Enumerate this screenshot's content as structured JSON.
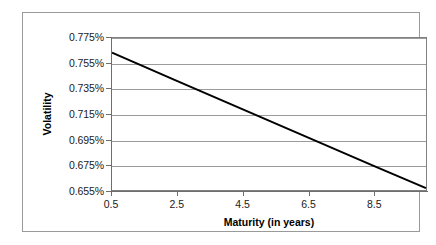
{
  "chart_data": {
    "type": "line",
    "title": "",
    "xlabel": "Maturity (in years)",
    "ylabel": "Volatility",
    "xlim": [
      0.5,
      10.1
    ],
    "ylim": [
      0.655,
      0.775
    ],
    "grid": true,
    "legend": false,
    "x_tick_labels": [
      "0.5",
      "2.5",
      "4.5",
      "6.5",
      "8.5"
    ],
    "x_tick_values": [
      0.5,
      2.5,
      4.5,
      6.5,
      8.5
    ],
    "y_tick_labels": [
      "0.775%",
      "0.755%",
      "0.735%",
      "0.715%",
      "0.695%",
      "0.675%",
      "0.655%"
    ],
    "y_tick_values": [
      0.775,
      0.755,
      0.735,
      0.715,
      0.695,
      0.675,
      0.655
    ],
    "y_unit": "%",
    "series": [
      {
        "name": "Volatility",
        "color": "#000000",
        "line_width": 2,
        "x": [
          0.5,
          2.5,
          4.5,
          6.5,
          8.5,
          10.1
        ],
        "y": [
          0.7635,
          0.741,
          0.7187,
          0.6963,
          0.674,
          0.6565
        ]
      }
    ]
  },
  "styling": {
    "plot_background": "#ffffff",
    "grid_color": "#9b9b9b",
    "axis_color": "#6e6e6e",
    "frame_color": "#9a9a9a",
    "text_color": "#1a1a1a"
  }
}
